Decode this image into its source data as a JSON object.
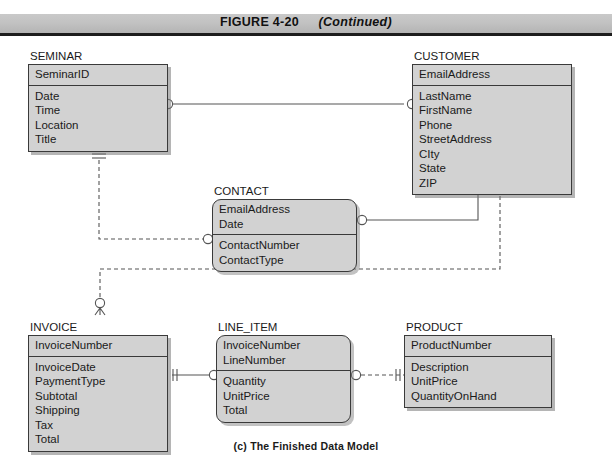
{
  "figure": {
    "label": "FIGURE 4-20",
    "continued": "(Continued)",
    "caption": "(c) The Finished Data Model"
  },
  "colors": {
    "entity_fill": "#d2d2d2",
    "entity_border": "#3a3a3a",
    "header_bar": "#c2c2c2",
    "header_rule": "#1d1d1d",
    "line": "#555555",
    "page_background": "#ffffff"
  },
  "diagram": {
    "type": "entity-relationship-diagram",
    "notation": "crows-foot",
    "entities": [
      {
        "id": "seminar",
        "name": "SEMINAR",
        "weak": false,
        "key_attributes": [
          "SeminarID"
        ],
        "attributes": [
          "Date",
          "Time",
          "Location",
          "Title"
        ]
      },
      {
        "id": "customer",
        "name": "CUSTOMER",
        "weak": false,
        "key_attributes": [
          "EmailAddress"
        ],
        "attributes": [
          "LastName",
          "FirstName",
          "Phone",
          "StreetAddress",
          "CIty",
          "State",
          "ZIP"
        ]
      },
      {
        "id": "contact",
        "name": "CONTACT",
        "weak": true,
        "key_attributes": [
          "EmailAddress",
          "Date"
        ],
        "attributes": [
          "ContactNumber",
          "ContactType"
        ]
      },
      {
        "id": "invoice",
        "name": "INVOICE",
        "weak": false,
        "key_attributes": [
          "InvoiceNumber"
        ],
        "attributes": [
          "InvoiceDate",
          "PaymentType",
          "Subtotal",
          "Shipping",
          "Tax",
          "Total"
        ]
      },
      {
        "id": "line_item",
        "name": "LINE_ITEM",
        "weak": true,
        "key_attributes": [
          "InvoiceNumber",
          "LineNumber"
        ],
        "attributes": [
          "Quantity",
          "UnitPrice",
          "Total"
        ]
      },
      {
        "id": "product",
        "name": "PRODUCT",
        "weak": false,
        "key_attributes": [
          "ProductNumber"
        ],
        "attributes": [
          "Description",
          "UnitPrice",
          "QuantityOnHand"
        ]
      }
    ],
    "relationships": [
      {
        "id": "seminar-customer",
        "from": "SEMINAR",
        "to": "CUSTOMER",
        "line_style": "solid",
        "from_cardinality": "zero-or-many",
        "to_cardinality": "zero-or-many"
      },
      {
        "id": "seminar-contact",
        "from": "SEMINAR",
        "to": "CONTACT",
        "line_style": "dashed",
        "from_cardinality": "exactly-one",
        "to_cardinality": "zero-or-many"
      },
      {
        "id": "customer-contact",
        "from": "CUSTOMER",
        "to": "CONTACT",
        "line_style": "solid",
        "from_cardinality": "exactly-one",
        "to_cardinality": "zero-or-many"
      },
      {
        "id": "customer-invoice",
        "from": "CUSTOMER",
        "to": "INVOICE",
        "line_style": "dashed",
        "from_cardinality": "exactly-one",
        "to_cardinality": "zero-or-many"
      },
      {
        "id": "invoice-line_item",
        "from": "INVOICE",
        "to": "LINE_ITEM",
        "line_style": "solid",
        "from_cardinality": "exactly-one",
        "to_cardinality": "zero-or-many"
      },
      {
        "id": "line_item-product",
        "from": "LINE_ITEM",
        "to": "PRODUCT",
        "line_style": "dashed",
        "from_cardinality": "zero-or-many",
        "to_cardinality": "exactly-one"
      }
    ]
  }
}
